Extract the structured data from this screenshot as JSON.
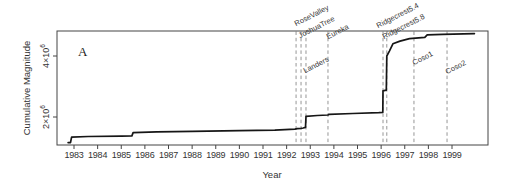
{
  "panel_label": "A",
  "colors": {
    "background": "#ffffff",
    "curve": "#161616",
    "event_line": "#8a8a8a",
    "frame": "#444444",
    "text": "#333333"
  },
  "chart_data": {
    "type": "line",
    "title": "",
    "xlabel": "Year",
    "ylabel": "Cumulative Magnitude",
    "grid": false,
    "legend": false,
    "xlim": [
      1982.3,
      2000.5
    ],
    "ylim": [
      1080000,
      4820000
    ],
    "y_unit": "x10^6",
    "x_ticks": [
      1983,
      1984,
      1985,
      1986,
      1987,
      1988,
      1989,
      1990,
      1991,
      1992,
      1993,
      1994,
      1995,
      1996,
      1997,
      1998,
      1999
    ],
    "y_ticks": [
      {
        "value_millions": 2,
        "mantissa": "2×10",
        "exponent": "6"
      },
      {
        "value_millions": 4,
        "mantissa": "4×10",
        "exponent": "6"
      }
    ],
    "series": [
      {
        "name": "cumulative-magnitude",
        "color": "#161616",
        "points_year_vs_millions": [
          [
            1982.75,
            1.16
          ],
          [
            1982.85,
            1.16
          ],
          [
            1982.9,
            1.34
          ],
          [
            1983.6,
            1.36
          ],
          [
            1985.0,
            1.375
          ],
          [
            1985.45,
            1.38
          ],
          [
            1985.5,
            1.49
          ],
          [
            1986.5,
            1.51
          ],
          [
            1988.0,
            1.53
          ],
          [
            1990.0,
            1.555
          ],
          [
            1991.5,
            1.57
          ],
          [
            1992.35,
            1.6
          ],
          [
            1992.45,
            1.615
          ],
          [
            1992.61,
            1.625
          ],
          [
            1992.7,
            1.64
          ],
          [
            1992.8,
            1.66
          ],
          [
            1992.82,
            2.02
          ],
          [
            1993.3,
            2.05
          ],
          [
            1993.75,
            2.065
          ],
          [
            1993.8,
            2.09
          ],
          [
            1994.8,
            2.115
          ],
          [
            1995.9,
            2.14
          ],
          [
            1996.07,
            2.15
          ],
          [
            1996.08,
            2.86
          ],
          [
            1996.22,
            2.88
          ],
          [
            1996.24,
            4.0
          ],
          [
            1996.35,
            4.16
          ],
          [
            1996.5,
            4.4
          ],
          [
            1996.8,
            4.49
          ],
          [
            1997.2,
            4.57
          ],
          [
            1997.85,
            4.61
          ],
          [
            1997.95,
            4.695
          ],
          [
            1998.6,
            4.71
          ],
          [
            1999.95,
            4.735
          ]
        ]
      }
    ],
    "events": [
      {
        "label": "RoseValley",
        "year": 1992.4
      },
      {
        "label": "JoshuaTree",
        "year": 1992.61
      },
      {
        "label": "Landers",
        "year": 1992.82
      },
      {
        "label": "Eureka",
        "year": 1993.75
      },
      {
        "label": "Ridgecrest5.4",
        "year": 1996.08
      },
      {
        "label": "Ridgecrest5.8",
        "year": 1996.24
      },
      {
        "label": "Coso1",
        "year": 1997.39
      },
      {
        "label": "Coso2",
        "year": 1998.79
      }
    ]
  }
}
